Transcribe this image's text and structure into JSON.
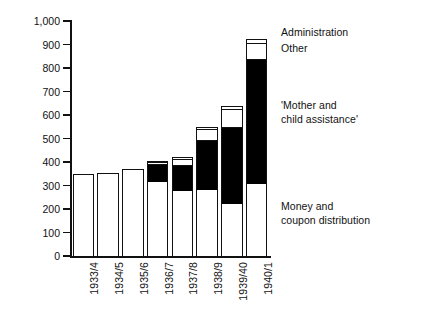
{
  "chart_data": {
    "type": "bar",
    "title": "",
    "subtitle": "",
    "xlabel": "",
    "ylabel": "Million RM",
    "ylim": [
      0,
      1000
    ],
    "ytick_values": [
      0,
      100,
      200,
      300,
      400,
      500,
      600,
      700,
      800,
      900,
      1000
    ],
    "ytick_labels": [
      "0",
      "100",
      "200",
      "300",
      "400",
      "500",
      "600",
      "700",
      "800",
      "900",
      "1,000"
    ],
    "grid": false,
    "stacked": true,
    "legend_position": "right-inline-annotations",
    "categories": [
      "1933/4",
      "1934/5",
      "1935/6",
      "1936/7",
      "1937/8",
      "1938/9",
      "1939/40",
      "1940/1"
    ],
    "series": [
      {
        "name": "Money and coupon distribution",
        "fill": "dotted-stipple",
        "values": [
          337,
          345,
          355,
          315,
          278,
          280,
          220,
          305
        ]
      },
      {
        "name": "'Mother and child assistance'",
        "fill": "solid-black",
        "values": [
          0,
          0,
          0,
          75,
          110,
          215,
          330,
          535
        ]
      },
      {
        "name": "Other",
        "fill": "checkered",
        "values": [
          10,
          10,
          15,
          8,
          25,
          45,
          75,
          65
        ]
      },
      {
        "name": "Administration",
        "fill": "white",
        "values": [
          0,
          0,
          0,
          8,
          8,
          10,
          15,
          18
        ]
      }
    ],
    "totals": [
      347,
      355,
      370,
      406,
      421,
      550,
      640,
      923
    ],
    "annotations": [
      {
        "text": "Administration",
        "series": "Administration"
      },
      {
        "text": "Other",
        "series": "Other"
      },
      {
        "text": "'Mother and\nchild assistance'",
        "series": "'Mother and child assistance'"
      },
      {
        "text": "Money and\ncoupon distribution",
        "series": "Money and coupon distribution"
      }
    ]
  },
  "colors": {
    "axis": "#111111",
    "text": "#111111",
    "money_and_coupon": "#ffffff",
    "mother_and_child": "#000000",
    "other": "#000000",
    "administration": "#ffffff",
    "background": "#ffffff"
  }
}
